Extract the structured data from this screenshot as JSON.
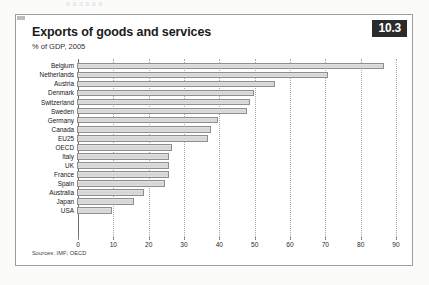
{
  "page": {
    "bleed_text": "a  a    a    a      a   a"
  },
  "panel": {
    "badge": "10.3",
    "title": "Exports of goods and services",
    "subtitle": "% of GDP, 2005",
    "source": "Sources: IMF; OECD"
  },
  "chart_data": {
    "type": "bar",
    "orientation": "horizontal",
    "title": "Exports of goods and services",
    "subtitle": "% of GDP, 2005",
    "xlabel": "",
    "ylabel": "",
    "xlim": [
      0,
      90
    ],
    "xticks": [
      0,
      10,
      20,
      30,
      40,
      50,
      60,
      70,
      80,
      90
    ],
    "grid": "vertical-dotted",
    "legend": "none",
    "bar_color": "#d9d9d9",
    "bar_border_color": "#8e8e8e",
    "categories": [
      "Belgium",
      "Netherlands",
      "Austria",
      "Denmark",
      "Switzerland",
      "Sweden",
      "Germany",
      "Canada",
      "EU25",
      "OECD",
      "Italy",
      "UK",
      "France",
      "Spain",
      "Australia",
      "Japan",
      "USA"
    ],
    "values": [
      87,
      71,
      56,
      50,
      49,
      48,
      40,
      38,
      37,
      27,
      26,
      26,
      26,
      25,
      19,
      16,
      10
    ]
  }
}
